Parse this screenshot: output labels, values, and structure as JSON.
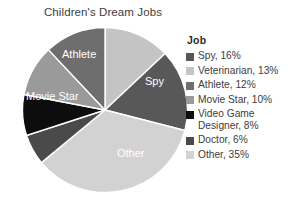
{
  "chart_data": {
    "type": "pie",
    "title": "Children's Dream Jobs",
    "legend_title": "Job",
    "legend_position": "right",
    "start_angle_deg": 0,
    "direction": "clockwise",
    "categories": [
      "Veterinarian",
      "Spy",
      "Other",
      "Doctor",
      "Video Game Designer",
      "Movie Star",
      "Athlete"
    ],
    "values": [
      13,
      16,
      35,
      6,
      8,
      10,
      12
    ],
    "unit": "%",
    "colors": [
      "#c4c4c4",
      "#585858",
      "#d2d2d2",
      "#4a4a4a",
      "#0d0d0d",
      "#9a9a9a",
      "#6e6e6e"
    ],
    "slice_labels": [
      {
        "name": "Spy",
        "text": "Spy",
        "x": 123,
        "y": 58
      },
      {
        "name": "Other",
        "text": "Other",
        "x": 95,
        "y": 130
      },
      {
        "name": "Movie Star",
        "text": "Movie Star",
        "x": 4,
        "y": 73
      },
      {
        "name": "Athlete",
        "text": "Athlete",
        "x": 40,
        "y": 31
      }
    ],
    "legend_entries": [
      {
        "label": "Spy, 16%",
        "category": "Spy",
        "value": 16,
        "color": "#585858"
      },
      {
        "label": "Veterinarian, 13%",
        "category": "Veterinarian",
        "value": 13,
        "color": "#c4c4c4"
      },
      {
        "label": "Athlete, 12%",
        "category": "Athlete",
        "value": 12,
        "color": "#6e6e6e"
      },
      {
        "label": "Movie Star, 10%",
        "category": "Movie Star",
        "value": 10,
        "color": "#9a9a9a"
      },
      {
        "label": "Video Game\nDesigner, 8%",
        "category": "Video Game Designer",
        "value": 8,
        "color": "#0d0d0d"
      },
      {
        "label": "Doctor, 6%",
        "category": "Doctor",
        "value": 6,
        "color": "#4a4a4a"
      },
      {
        "label": "Other, 35%",
        "category": "Other",
        "value": 35,
        "color": "#d2d2d2"
      }
    ]
  },
  "figure": {
    "title": "Children's Dream Jobs",
    "background": "#ffffff"
  },
  "legend": {
    "title": "Job"
  }
}
